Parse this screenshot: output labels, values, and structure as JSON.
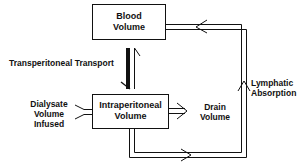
{
  "diagram": {
    "nodes": [
      {
        "id": "blood",
        "line1": "Blood",
        "line2": "Volume"
      },
      {
        "id": "intraperitoneal",
        "line1": "Intraperitoneal",
        "line2": "Volume"
      }
    ],
    "labels": {
      "transport": "Transperitoneal Transport",
      "dialysate_1": "Dialysate",
      "dialysate_2": "Volume",
      "dialysate_3": "Infused",
      "drain_1": "Drain",
      "drain_2": "Volume",
      "lymph_1": "Lymphatic",
      "lymph_2": "Absorption"
    },
    "edges": [
      {
        "from": "blood",
        "to": "intraperitoneal",
        "label": "Transperitoneal Transport",
        "bidirectional": true
      },
      {
        "from": "dialysate",
        "to": "intraperitoneal",
        "label": "Dialysate Volume Infused"
      },
      {
        "from": "intraperitoneal",
        "to": "drain",
        "label": "Drain Volume"
      },
      {
        "from": "intraperitoneal",
        "to": "blood",
        "label": "Lymphatic Absorption"
      }
    ]
  }
}
